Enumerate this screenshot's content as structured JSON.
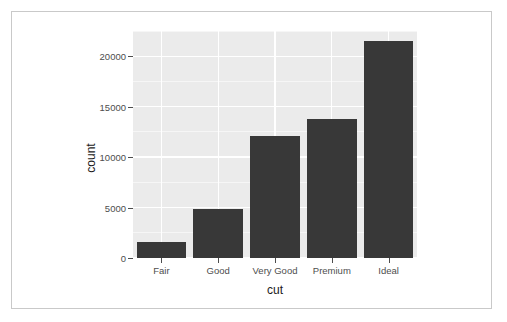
{
  "chart_data": {
    "type": "bar",
    "title": "",
    "subtitle": "",
    "xlabel": "cut",
    "ylabel": "count",
    "categories": [
      "Fair",
      "Good",
      "Very Good",
      "Premium",
      "Ideal"
    ],
    "values": [
      1610,
      4906,
      12082,
      13791,
      21551
    ],
    "ylim": [
      0,
      22500
    ],
    "y_ticks": [
      0,
      5000,
      10000,
      15000,
      20000
    ],
    "y_tick_labels": [
      "0",
      "5000",
      "10000",
      "15000",
      "20000"
    ],
    "grid": "major-and-minor-white-on-gray",
    "legend": "none",
    "bar_color": "#383838",
    "panel_background": "#ebebeb",
    "gridline_color": "#ffffff",
    "axis_text_color": "#4d4d4d",
    "axis_title_color": "#1a1a1a",
    "frame_color": "#c9c9c9",
    "page_background": "#ffffff"
  }
}
